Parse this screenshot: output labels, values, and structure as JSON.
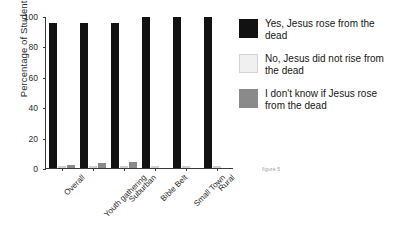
{
  "chart_data": {
    "type": "bar",
    "title": "",
    "xlabel": "",
    "ylabel": "Percentage of Students",
    "ylim": [
      0,
      100
    ],
    "yticks": [
      0,
      20,
      40,
      60,
      80,
      100
    ],
    "grid": false,
    "legend_position": "right",
    "categories": [
      "Overall",
      "Youth gathering",
      "Suburban",
      "Bible Belt",
      "Small Town",
      "Rural"
    ],
    "series": [
      {
        "name": "Yes, Jesus rose from the dead",
        "color": "#121212",
        "values": [
          96,
          96,
          96,
          100,
          100,
          100
        ]
      },
      {
        "name": "No, Jesus did not rise from the dead",
        "color": "#f0f0f0",
        "values": [
          1,
          1,
          0,
          0,
          0,
          0
        ]
      },
      {
        "name": "I don't know if Jesus rose from the dead",
        "color": "#8a8a8a",
        "values": [
          2,
          3,
          4,
          0,
          0,
          0
        ]
      }
    ],
    "caption": "figure 5"
  },
  "axis": {
    "ylabel": "Percentage of Students",
    "ticks": [
      "100",
      "80",
      "60",
      "40",
      "20",
      "0"
    ]
  },
  "legend": {
    "items": [
      {
        "label": "Yes, Jesus rose from the dead"
      },
      {
        "label": "No, Jesus did not rise from the dead"
      },
      {
        "label": "I don't know if Jesus rose from the dead"
      }
    ]
  },
  "caption": {
    "text": "figure 5"
  }
}
